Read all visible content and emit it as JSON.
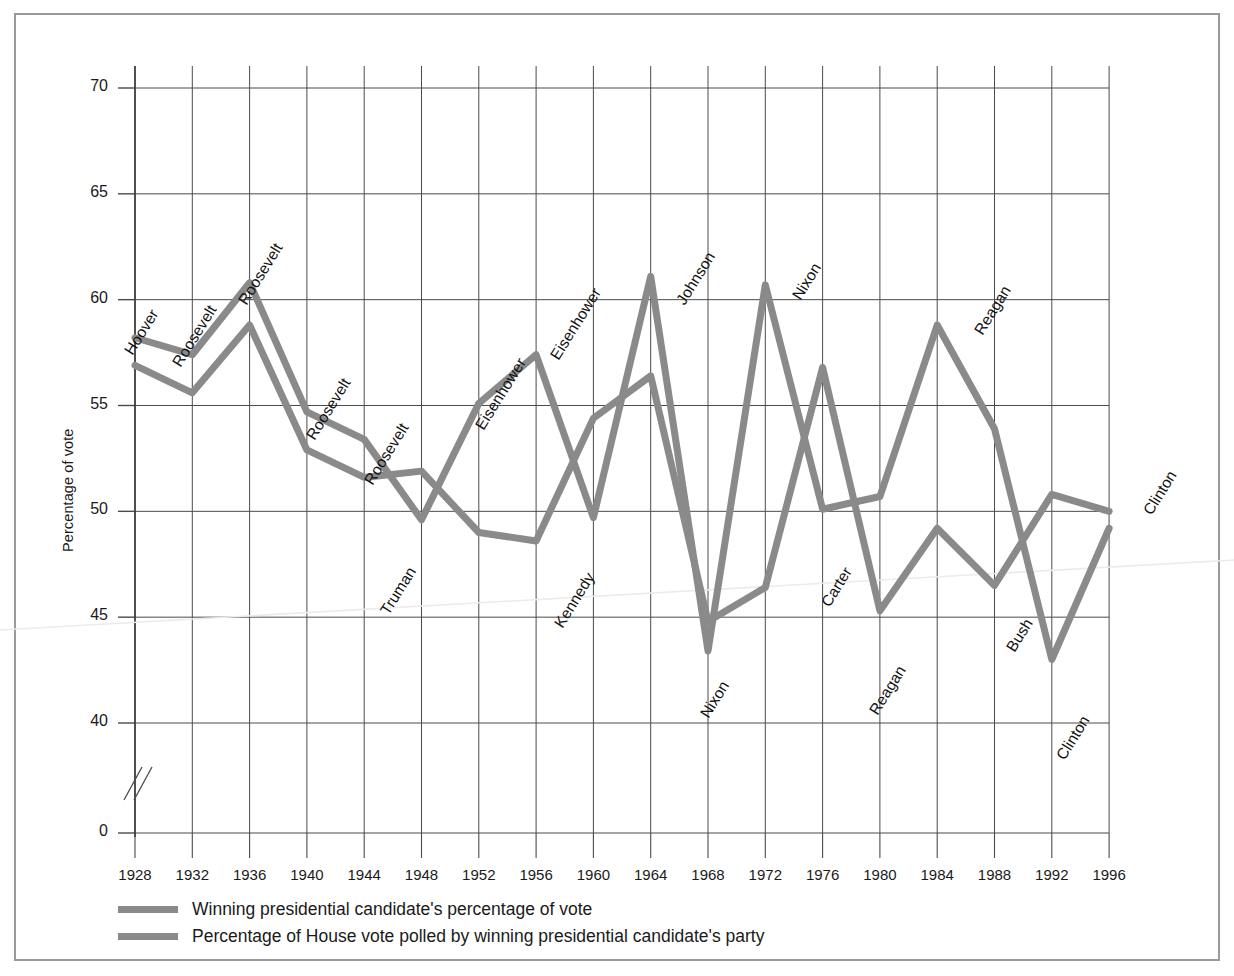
{
  "figure": {
    "ylabel": "Percentage of vote",
    "yticks": [
      70,
      65,
      60,
      55,
      50,
      45,
      40,
      0
    ],
    "axis_break": true
  },
  "legend": {
    "items": [
      {
        "label": "Winning presidential candidate's percentage of vote",
        "color": "#8a8a8a"
      },
      {
        "label": "Percentage of House vote polled by winning presidential candidate's party",
        "color": "#8a8a8a"
      }
    ]
  },
  "chart_data": {
    "type": "line",
    "title": "",
    "xlabel": "",
    "ylabel": "Percentage of vote",
    "ylim": [
      38,
      72
    ],
    "yticks": [
      40,
      45,
      50,
      55,
      60,
      65,
      70
    ],
    "grid": true,
    "legend_position": "below",
    "categories": [
      1928,
      1932,
      1936,
      1940,
      1944,
      1948,
      1952,
      1956,
      1960,
      1964,
      1968,
      1972,
      1976,
      1980,
      1984,
      1988,
      1992,
      1996
    ],
    "series": [
      {
        "name": "Winning presidential candidate's percentage of vote",
        "color": "#8a8a8a",
        "values": [
          58.2,
          57.4,
          60.8,
          54.7,
          53.4,
          49.6,
          55.1,
          57.4,
          49.7,
          61.1,
          43.4,
          60.7,
          50.1,
          50.7,
          58.8,
          53.9,
          43.0,
          49.2
        ]
      },
      {
        "name": "Percentage of House vote polled by winning presidential candidate's party",
        "color": "#8a8a8a",
        "values": [
          56.9,
          55.6,
          58.8,
          52.9,
          51.6,
          51.9,
          49.0,
          48.6,
          54.4,
          56.4,
          44.8,
          46.4,
          56.8,
          45.3,
          49.2,
          46.5,
          50.8,
          50.0
        ]
      }
    ],
    "annotations": [
      {
        "text": "Hoover",
        "year": 1928,
        "series": 0,
        "value": 58.2
      },
      {
        "text": "Roosevelt",
        "year": 1932,
        "series": 0,
        "value": 57.4
      },
      {
        "text": "Roosevelt",
        "year": 1936,
        "series": 0,
        "value": 60.8
      },
      {
        "text": "Roosevelt",
        "year": 1940,
        "series": 0,
        "value": 54.7
      },
      {
        "text": "Roosevelt",
        "year": 1944,
        "series": 0,
        "value": 53.4
      },
      {
        "text": "Truman",
        "year": 1948,
        "series": 0,
        "value": 49.6
      },
      {
        "text": "Eisenhower",
        "year": 1952,
        "series": 0,
        "value": 55.1
      },
      {
        "text": "Eisenhower",
        "year": 1956,
        "series": 0,
        "value": 57.4
      },
      {
        "text": "Kennedy",
        "year": 1960,
        "series": 0,
        "value": 49.7
      },
      {
        "text": "Johnson",
        "year": 1964,
        "series": 0,
        "value": 61.1
      },
      {
        "text": "Nixon",
        "year": 1968,
        "series": 0,
        "value": 43.4
      },
      {
        "text": "Nixon",
        "year": 1972,
        "series": 0,
        "value": 60.7
      },
      {
        "text": "Carter",
        "year": 1976,
        "series": 0,
        "value": 50.1
      },
      {
        "text": "Reagan",
        "year": 1980,
        "series": 0,
        "value": 45.3
      },
      {
        "text": "Reagan",
        "year": 1984,
        "series": 0,
        "value": 58.8
      },
      {
        "text": "Bush",
        "year": 1988,
        "series": 0,
        "value": 53.9
      },
      {
        "text": "Clinton",
        "year": 1992,
        "series": 0,
        "value": 43.0
      },
      {
        "text": "Clinton",
        "year": 1996,
        "series": 0,
        "value": 49.2
      }
    ]
  },
  "label_layout": [
    {
      "text": "Hoover",
      "x": 136,
      "y": 340
    },
    {
      "text": "Roosevelt",
      "x": 184,
      "y": 352
    },
    {
      "text": "Roosevelt",
      "x": 250,
      "y": 290
    },
    {
      "text": "Roosevelt",
      "x": 318,
      "y": 425
    },
    {
      "text": "Roosevelt",
      "x": 376,
      "y": 470
    },
    {
      "text": "Truman",
      "x": 392,
      "y": 600
    },
    {
      "text": "Eisenhower",
      "x": 487,
      "y": 415
    },
    {
      "text": "Eisenhower",
      "x": 562,
      "y": 345
    },
    {
      "text": "Kennedy",
      "x": 566,
      "y": 613
    },
    {
      "text": "Johnson",
      "x": 688,
      "y": 290
    },
    {
      "text": "Nixon",
      "x": 712,
      "y": 703
    },
    {
      "text": "Nixon",
      "x": 804,
      "y": 285
    },
    {
      "text": "Carter",
      "x": 833,
      "y": 592
    },
    {
      "text": "Reagan",
      "x": 881,
      "y": 700
    },
    {
      "text": "Reagan",
      "x": 986,
      "y": 320
    },
    {
      "text": "Bush",
      "x": 1018,
      "y": 637
    },
    {
      "text": "Clinton",
      "x": 1068,
      "y": 745
    },
    {
      "text": "Clinton",
      "x": 1155,
      "y": 500
    }
  ]
}
